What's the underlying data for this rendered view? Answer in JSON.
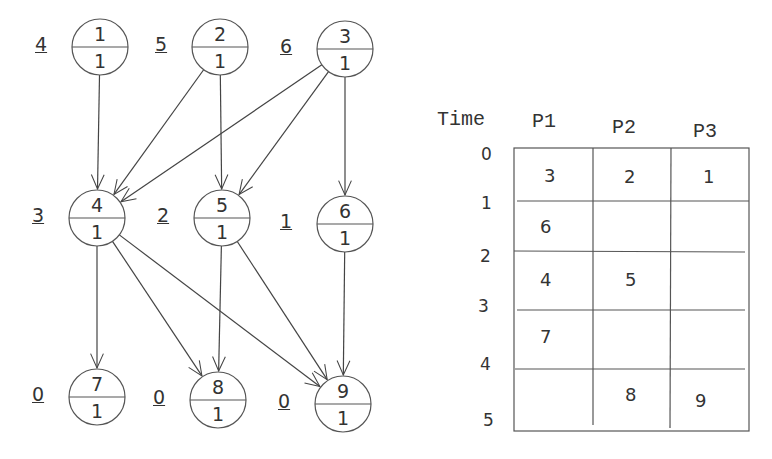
{
  "graph": {
    "nodes": [
      {
        "id": "1",
        "weight": "1",
        "level": "4",
        "cx": 100,
        "cy": 47
      },
      {
        "id": "2",
        "weight": "1",
        "level": "5",
        "cx": 220,
        "cy": 47
      },
      {
        "id": "3",
        "weight": "1",
        "level": "6",
        "cx": 345,
        "cy": 49
      },
      {
        "id": "4",
        "weight": "1",
        "level": "3",
        "cx": 97,
        "cy": 218
      },
      {
        "id": "5",
        "weight": "1",
        "level": "2",
        "cx": 222,
        "cy": 218
      },
      {
        "id": "6",
        "weight": "1",
        "level": "1",
        "cx": 345,
        "cy": 224
      },
      {
        "id": "7",
        "weight": "1",
        "level": "0",
        "cx": 97,
        "cy": 397
      },
      {
        "id": "8",
        "weight": "1",
        "level": "0",
        "cx": 218,
        "cy": 400
      },
      {
        "id": "9",
        "weight": "1",
        "level": "0",
        "cx": 343,
        "cy": 404
      }
    ],
    "edges": [
      [
        "1",
        "4"
      ],
      [
        "2",
        "4"
      ],
      [
        "3",
        "4"
      ],
      [
        "2",
        "5"
      ],
      [
        "3",
        "5"
      ],
      [
        "3",
        "6"
      ],
      [
        "4",
        "7"
      ],
      [
        "4",
        "8"
      ],
      [
        "4",
        "9"
      ],
      [
        "5",
        "8"
      ],
      [
        "5",
        "9"
      ],
      [
        "6",
        "9"
      ]
    ]
  },
  "schedule": {
    "time_header": "Time",
    "processors": [
      "P1",
      "P2",
      "P3"
    ],
    "time_ticks": [
      "0",
      "1",
      "2",
      "3",
      "4",
      "5"
    ],
    "rows": [
      [
        "3",
        "2",
        "1"
      ],
      [
        "6",
        "",
        ""
      ],
      [
        "4",
        "5",
        ""
      ],
      [
        "7",
        "",
        ""
      ],
      [
        "",
        "8",
        "9"
      ]
    ]
  }
}
